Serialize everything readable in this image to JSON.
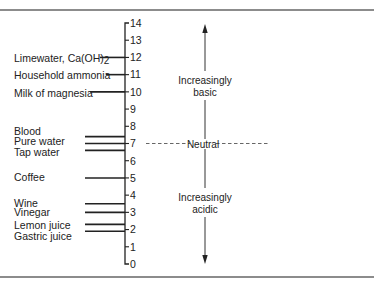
{
  "diagram": {
    "axis": {
      "min": 0,
      "max": 14,
      "ticks": [
        "0",
        "1",
        "2",
        "3",
        "4",
        "5",
        "6",
        "7",
        "8",
        "9",
        "10",
        "11",
        "12",
        "13",
        "14"
      ]
    },
    "substances": [
      {
        "name": "Limewater, Ca(OH)",
        "subscript": "2",
        "ph": 12
      },
      {
        "name": "Household ammonia",
        "subscript": "",
        "ph": 11
      },
      {
        "name": "Milk of magnesia",
        "subscript": "",
        "ph": 10
      },
      {
        "name": "Blood",
        "subscript": "",
        "ph": 7.4
      },
      {
        "name": "Pure water",
        "subscript": "",
        "ph": 7
      },
      {
        "name": "Tap water",
        "subscript": "",
        "ph": 6.6
      },
      {
        "name": "Coffee",
        "subscript": "",
        "ph": 5
      },
      {
        "name": "Wine",
        "subscript": "",
        "ph": 3.5
      },
      {
        "name": "Vinegar",
        "subscript": "",
        "ph": 3
      },
      {
        "name": "Lemon juice",
        "subscript": "",
        "ph": 2.3
      },
      {
        "name": "Gastric juice",
        "subscript": "",
        "ph": 1.9
      }
    ],
    "regions": {
      "basic": {
        "line1": "Increasingly",
        "line2": "basic"
      },
      "neutral": {
        "label": "Neutral"
      },
      "acidic": {
        "line1": "Increasingly",
        "line2": "acidic"
      }
    },
    "colors": {
      "ink": "#222222",
      "rule": "#666666",
      "background": "#ffffff"
    }
  }
}
